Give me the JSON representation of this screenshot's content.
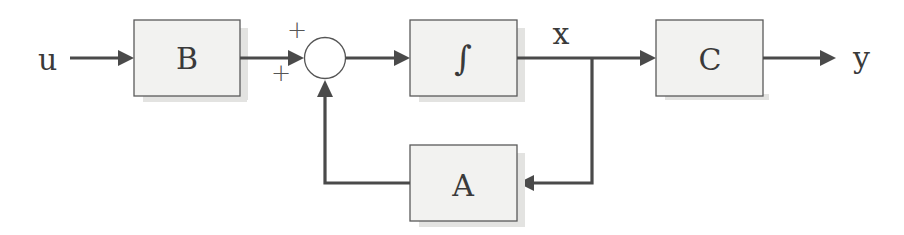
{
  "diagram": {
    "type": "state-space block diagram",
    "signals": {
      "input": "u",
      "state": "x",
      "output": "y"
    },
    "blocks": {
      "input_matrix": "B",
      "integrator": "∫",
      "output_matrix": "C",
      "state_matrix": "A"
    },
    "summing_junction": {
      "top_sign": "+",
      "left_sign": "+"
    },
    "colors": {
      "block_fill": "#f2f2f0",
      "block_border": "#5a5a5a",
      "wire": "#4a4a4a",
      "text": "#3a3a3a"
    }
  }
}
